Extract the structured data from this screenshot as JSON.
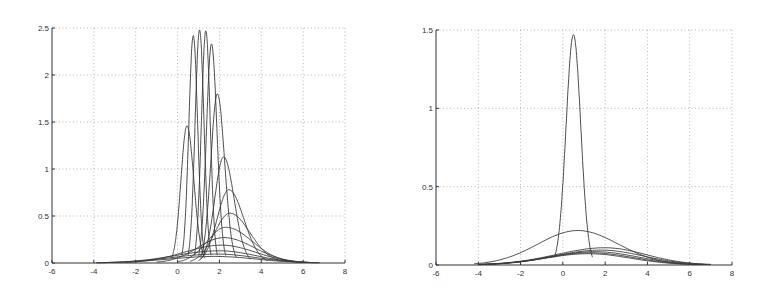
{
  "chart_data": [
    {
      "type": "line",
      "title": "",
      "xlabel": "",
      "ylabel": "",
      "xlim": [
        -6,
        8
      ],
      "ylim": [
        0,
        2.5
      ],
      "xticks": [
        -6,
        -4,
        -2,
        0,
        2,
        4,
        6,
        8
      ],
      "yticks": [
        0,
        0.5,
        1,
        1.5,
        2,
        2.5
      ],
      "xtick_labels": [
        "-6",
        "-4",
        "-2",
        "0",
        "2",
        "4",
        "6",
        "8"
      ],
      "ytick_labels": [
        "0",
        "0.5",
        "1",
        "1.5",
        "2",
        "2.5"
      ],
      "grid": true,
      "legend": null,
      "plot_box": {
        "left": 52,
        "right": 345,
        "top": 28,
        "bottom": 263
      },
      "description": "Family of Gaussian-like density curves; narrow tall peaks near x=0.5-1.6 progressively broadening and shifting right",
      "series": [
        {
          "name": "c1",
          "mu": 0.45,
          "peak": 1.46,
          "x_start": -0.3,
          "x_end": 1.3
        },
        {
          "name": "c2",
          "mu": 0.75,
          "peak": 2.42,
          "x_start": 0.2,
          "x_end": 1.3
        },
        {
          "name": "c3",
          "mu": 1.05,
          "peak": 2.48,
          "x_start": 0.5,
          "x_end": 1.6
        },
        {
          "name": "c4",
          "mu": 1.35,
          "peak": 2.47,
          "x_start": 0.8,
          "x_end": 1.9
        },
        {
          "name": "c5",
          "mu": 1.62,
          "peak": 2.33,
          "x_start": 1.0,
          "x_end": 2.3
        },
        {
          "name": "c6",
          "mu": 1.9,
          "peak": 1.8,
          "x_start": 1.1,
          "x_end": 2.8
        },
        {
          "name": "c7",
          "mu": 2.2,
          "peak": 1.13,
          "x_start": 1.1,
          "x_end": 3.5
        },
        {
          "name": "c8",
          "mu": 2.45,
          "peak": 0.78,
          "x_start": 1.0,
          "x_end": 4.3
        },
        {
          "name": "c9",
          "mu": 2.5,
          "peak": 0.53,
          "x_start": 0.6,
          "x_end": 5.0
        },
        {
          "name": "c10",
          "mu": 2.3,
          "peak": 0.38,
          "x_start": 0.0,
          "x_end": 5.6
        },
        {
          "name": "c11",
          "mu": 2.2,
          "peak": 0.27,
          "x_start": -1.0,
          "x_end": 6.0
        },
        {
          "name": "c12",
          "mu": 2.1,
          "peak": 0.19,
          "x_start": -2.5,
          "x_end": 6.3
        },
        {
          "name": "c13",
          "mu": 2.0,
          "peak": 0.13,
          "x_start": -3.5,
          "x_end": 6.5
        },
        {
          "name": "c14",
          "mu": 1.9,
          "peak": 0.095,
          "x_start": -3.8,
          "x_end": 6.7
        },
        {
          "name": "c15",
          "mu": 1.8,
          "peak": 0.07,
          "x_start": -3.9,
          "x_end": 6.8
        }
      ]
    },
    {
      "type": "line",
      "title": "",
      "xlabel": "",
      "ylabel": "",
      "xlim": [
        -6,
        8
      ],
      "ylim": [
        0,
        1.5
      ],
      "xticks": [
        -6,
        -4,
        -2,
        0,
        2,
        4,
        6,
        8
      ],
      "yticks": [
        0,
        0.5,
        1,
        1.5
      ],
      "xtick_labels": [
        "-6",
        "-4",
        "-2",
        "0",
        "2",
        "4",
        "6",
        "8"
      ],
      "ytick_labels": [
        "0",
        "0.5",
        "1",
        "1.5"
      ],
      "grid": true,
      "legend": null,
      "plot_box": {
        "left": 436,
        "right": 732,
        "top": 30,
        "bottom": 265
      },
      "description": "One narrow tall peak near x=0.5, one medium-width curve, and several broad flat curves",
      "series": [
        {
          "name": "d1",
          "mu": 0.5,
          "peak": 1.47,
          "x_start": -0.4,
          "x_end": 1.4
        },
        {
          "name": "d2",
          "mu": 0.7,
          "peak": 0.22,
          "x_start": -4.2,
          "x_end": 5.7
        },
        {
          "name": "d3",
          "mu": 2.0,
          "peak": 0.11,
          "x_start": -4.0,
          "x_end": 7.0
        },
        {
          "name": "d4",
          "mu": 1.8,
          "peak": 0.095,
          "x_start": -4.0,
          "x_end": 7.0
        },
        {
          "name": "d5",
          "mu": 1.5,
          "peak": 0.085,
          "x_start": -4.0,
          "x_end": 6.8
        },
        {
          "name": "d6",
          "mu": 1.3,
          "peak": 0.078,
          "x_start": -4.0,
          "x_end": 6.6
        },
        {
          "name": "d7",
          "mu": 1.2,
          "peak": 0.072,
          "x_start": -4.0,
          "x_end": 6.4
        }
      ]
    }
  ]
}
